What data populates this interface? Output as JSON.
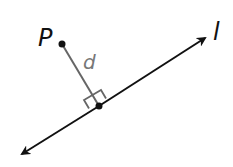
{
  "diagram": {
    "type": "geometry",
    "point": {
      "label": "P",
      "x": 62,
      "y": 44
    },
    "line": {
      "label": "l",
      "from": [
        20,
        155
      ],
      "to": [
        207,
        37
      ]
    },
    "foot": {
      "x": 99,
      "y": 106
    },
    "segment_label": "d",
    "colors": {
      "line": "#111111",
      "segment": "#666666",
      "right_angle": "#666666",
      "label": "#111111",
      "segment_label": "#777777"
    }
  }
}
